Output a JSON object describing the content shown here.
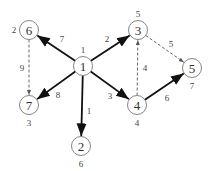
{
  "diagram": {
    "type": "directed-graph",
    "nodes": [
      {
        "id": "1",
        "label": "1",
        "value": "1",
        "x": 83,
        "y": 66,
        "value_pos": "top"
      },
      {
        "id": "2",
        "label": "2",
        "value": "6",
        "x": 81,
        "y": 146,
        "value_pos": "bottom"
      },
      {
        "id": "3",
        "label": "3",
        "value": "5",
        "x": 138,
        "y": 30,
        "value_pos": "top"
      },
      {
        "id": "4",
        "label": "4",
        "value": "4",
        "x": 137,
        "y": 105,
        "value_pos": "bottom"
      },
      {
        "id": "5",
        "label": "5",
        "value": "7",
        "x": 192,
        "y": 68,
        "value_pos": "bottom"
      },
      {
        "id": "6",
        "label": "6",
        "value": "2",
        "x": 29,
        "y": 30,
        "value_pos": "left"
      },
      {
        "id": "7",
        "label": "7",
        "value": "3",
        "x": 29,
        "y": 105,
        "value_pos": "bottom"
      }
    ],
    "edges": [
      {
        "from": "1",
        "to": "6",
        "weight": "7",
        "style": "solid",
        "lx": 62,
        "ly": 42
      },
      {
        "from": "1",
        "to": "3",
        "weight": "2",
        "style": "solid",
        "lx": 107,
        "ly": 42
      },
      {
        "from": "1",
        "to": "7",
        "weight": "8",
        "style": "solid",
        "lx": 58,
        "ly": 98
      },
      {
        "from": "1",
        "to": "2",
        "weight": "1",
        "style": "solid",
        "lx": 89,
        "ly": 114
      },
      {
        "from": "1",
        "to": "4",
        "weight": "3",
        "style": "solid",
        "lx": 110,
        "ly": 99
      },
      {
        "from": "4",
        "to": "5",
        "weight": "6",
        "style": "solid",
        "lx": 167,
        "ly": 101
      },
      {
        "from": "6",
        "to": "7",
        "weight": "9",
        "style": "dashed",
        "lx": 22,
        "ly": 71
      },
      {
        "from": "4",
        "to": "3",
        "weight": "4",
        "style": "dashed",
        "lx": 145,
        "ly": 71
      },
      {
        "from": "3",
        "to": "5",
        "weight": "5",
        "style": "dashed",
        "lx": 171,
        "ly": 47
      }
    ]
  }
}
